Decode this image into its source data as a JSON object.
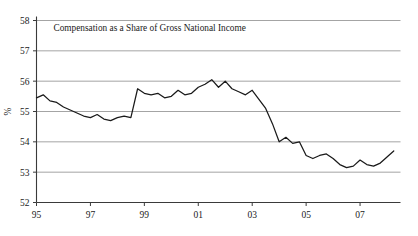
{
  "chart_data": {
    "type": "line",
    "title": "Compensation as a Share of Gross National Income",
    "xlabel": "",
    "ylabel": "%",
    "ylim": [
      52,
      58
    ],
    "xlim": [
      1995.0,
      2008.5
    ],
    "grid": true,
    "legend": false,
    "ytick_labels": [
      "58",
      "57",
      "56",
      "55",
      "54",
      "53",
      "52"
    ],
    "ytick_values": [
      58,
      57,
      56,
      55,
      54,
      53,
      52
    ],
    "xtick_labels": [
      "95",
      "97",
      "99",
      "01",
      "03",
      "05",
      "07"
    ],
    "xtick_values": [
      1995,
      1997,
      1999,
      2001,
      2003,
      2005,
      2007
    ],
    "series": [
      {
        "name": "Compensation share of GNI",
        "x": [
          1995.0,
          1995.25,
          1995.5,
          1995.75,
          1996.0,
          1996.25,
          1996.5,
          1996.75,
          1997.0,
          1997.25,
          1997.5,
          1997.75,
          1998.0,
          1998.25,
          1998.5,
          1998.75,
          1999.0,
          1999.25,
          1999.5,
          1999.75,
          2000.0,
          2000.25,
          2000.5,
          2000.75,
          2001.0,
          2001.25,
          2001.5,
          2001.75,
          2002.0,
          2002.25,
          2002.5,
          2002.75,
          2003.0,
          2003.25,
          2003.5,
          2003.75,
          2004.0,
          2004.25,
          2004.5,
          2004.75,
          2005.0,
          2005.25,
          2005.5,
          2005.75,
          2006.0,
          2006.25,
          2006.5,
          2006.75,
          2007.0,
          2007.25,
          2007.5,
          2007.75,
          2008.0,
          2008.25
        ],
        "values": [
          55.45,
          55.55,
          55.35,
          55.3,
          55.15,
          55.05,
          54.95,
          54.85,
          54.8,
          54.9,
          54.75,
          54.7,
          54.8,
          54.85,
          54.8,
          55.75,
          55.6,
          55.55,
          55.6,
          55.45,
          55.5,
          55.7,
          55.55,
          55.6,
          55.8,
          55.9,
          56.05,
          55.8,
          56.0,
          55.75,
          55.65,
          55.55,
          55.7,
          55.4,
          55.1,
          54.6,
          54.0,
          54.15,
          53.95,
          54.0,
          53.55,
          53.45,
          53.55,
          53.6,
          53.45,
          53.25,
          53.15,
          53.2,
          53.4,
          53.25,
          53.2,
          53.3,
          53.5,
          53.7
        ]
      }
    ]
  }
}
